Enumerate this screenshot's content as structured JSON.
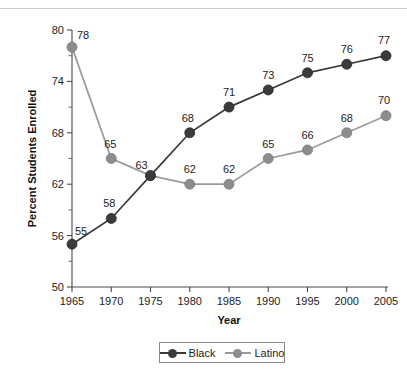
{
  "chart_data": {
    "type": "line",
    "title": "",
    "xlabel": "Year",
    "ylabel": "Percent Students Enrolled",
    "categories": [
      1965,
      1970,
      1975,
      1980,
      1985,
      1990,
      1995,
      2000,
      2005
    ],
    "x_tick_labels": [
      "1965",
      "1970",
      "1975",
      "1980",
      "1985",
      "1990",
      "1995",
      "2000",
      "2005"
    ],
    "y_tick_labels": [
      "50",
      "56",
      "62",
      "68",
      "74",
      "80"
    ],
    "y_major_ticks": [
      50,
      56,
      62,
      68,
      74,
      80
    ],
    "y_minor_ticks": [
      53,
      59,
      65,
      71,
      77
    ],
    "ylim": [
      50,
      80
    ],
    "xlim": [
      1965,
      2005
    ],
    "grid": false,
    "legend_position": "bottom",
    "series": [
      {
        "name": "Black",
        "color": "#3b3b3b",
        "line_color": "#383838",
        "values": [
          55,
          58,
          63,
          68,
          71,
          73,
          75,
          76,
          77
        ],
        "labels": [
          "55",
          "58",
          "63",
          "68",
          "71",
          "73",
          "75",
          "76",
          "77"
        ]
      },
      {
        "name": "Latino",
        "color": "#8d8d8d",
        "line_color": "#9a9a9a",
        "values": [
          78,
          65,
          63,
          62,
          62,
          65,
          66,
          68,
          70
        ],
        "labels": [
          "78",
          "65",
          "63",
          "62",
          "62",
          "65",
          "66",
          "68",
          "70"
        ]
      }
    ]
  },
  "legend": {
    "items": [
      {
        "label": "Black"
      },
      {
        "label": "Latino"
      }
    ]
  },
  "axes": {
    "x_title": "Year",
    "y_title": "Percent Students Enrolled"
  }
}
